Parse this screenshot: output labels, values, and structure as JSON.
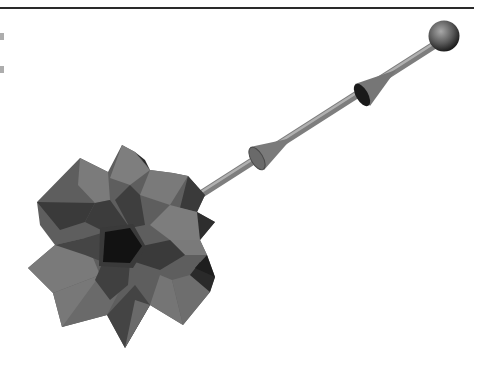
{
  "figure": {
    "background": "#ffffff",
    "rule_color": "#2a2a2a",
    "colors": {
      "face_light": "#7b7b7b",
      "face_mid": "#5e5e5e",
      "face_dark": "#3a3a3a",
      "face_darkest": "#151515",
      "rod": "#8a8a8a",
      "rod_highlight": "#b5b5b5",
      "cone": "#7a7a7a",
      "sphere_light": "#9a9a9a",
      "sphere_dark": "#2c2c2c"
    },
    "star_outline": "37,202 80,158 108,172 122,145 135,152 150,170 173,173 188,176 205,195 197,212 215,222 200,240 207,255 215,277 210,292 183,325 150,305 125,348 107,315 62,327 53,293 28,268 55,245 40,225",
    "central_pentagon": "105,232 130,228 142,246 130,263 103,262",
    "rod": {
      "x1": 195,
      "y1": 198,
      "x2": 436,
      "y2": 44,
      "width": 8
    },
    "cones": [
      {
        "tip": "292,138",
        "base_a": "250,147",
        "base_b": "264,170"
      },
      {
        "tip": "396,70",
        "base_a": "355,84",
        "base_b": "370,106"
      }
    ],
    "sphere": {
      "cx": 444,
      "cy": 36,
      "r": 15
    }
  }
}
